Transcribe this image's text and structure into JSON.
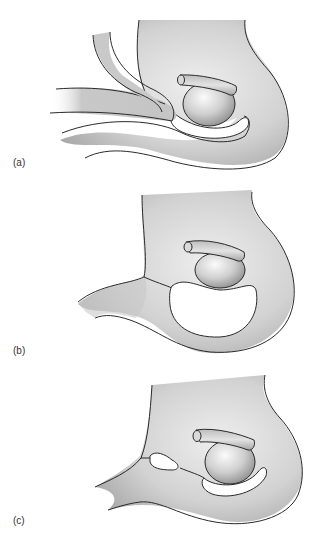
{
  "figure": {
    "panels": [
      {
        "label": "(a)"
      },
      {
        "label": "(b)"
      },
      {
        "label": "(c)"
      }
    ],
    "colors": {
      "outline": "#2a2a2a",
      "tissue_light": "#e6e6e6",
      "tissue_mid": "#c4c4c4",
      "tissue_dark": "#9c9c9c",
      "cavity": "#ffffff",
      "background": "#ffffff"
    }
  }
}
